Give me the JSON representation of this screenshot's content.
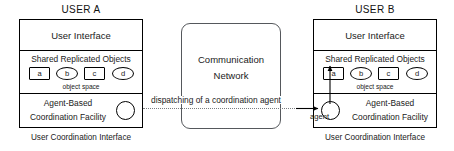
{
  "diagram": {
    "title_visible": false,
    "colors": {
      "stroke": "#000000",
      "comm_stroke": "#55585c",
      "dotted": "#7a7d80",
      "background": "#ffffff"
    }
  },
  "user_a": {
    "title": "USER  A",
    "ui_row_label": "User Interface",
    "shared_objects_label": "Shared Replicated Objects",
    "object_space_label": "object space",
    "facility_line1": "Agent-Based",
    "facility_line2": "Coordination Facility",
    "caption": "User Coordination Interface",
    "objects": [
      {
        "label": "a",
        "shape": "square"
      },
      {
        "label": "b",
        "shape": "ellipse"
      },
      {
        "label": "c",
        "shape": "square"
      },
      {
        "label": "d",
        "shape": "ellipse"
      }
    ]
  },
  "user_b": {
    "title": "USER  B",
    "ui_row_label": "User Interface",
    "shared_objects_label": "Shared Replicated Objects",
    "object_space_label": "object space",
    "facility_line1": "Agent-Based",
    "facility_line2": "Coordination Facility",
    "caption": "User Coordination Interface",
    "agent_label": "agent",
    "objects": [
      {
        "label": "a",
        "shape": "square"
      },
      {
        "label": "b",
        "shape": "ellipse"
      },
      {
        "label": "c",
        "shape": "square"
      },
      {
        "label": "d",
        "shape": "ellipse"
      }
    ]
  },
  "network": {
    "line1": "Communication",
    "line2": "Network"
  },
  "dispatch": {
    "label": "dispatching of a  coordination agent"
  }
}
